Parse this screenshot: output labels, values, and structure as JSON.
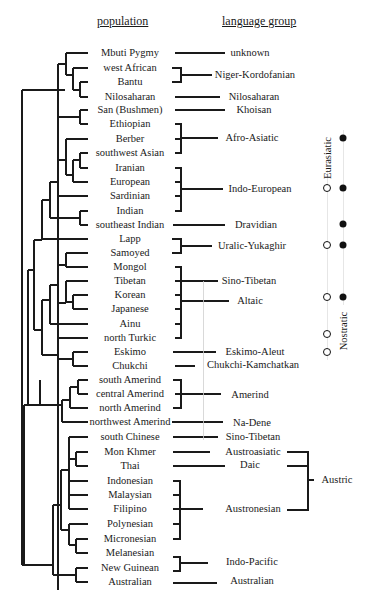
{
  "headers": {
    "population": "population",
    "language_group": "language group"
  },
  "populations": [
    {
      "name": "Mbuti Pygmy",
      "y": 53
    },
    {
      "name": "west African",
      "y": 68
    },
    {
      "name": "Bantu",
      "y": 82
    },
    {
      "name": "Nilosaharan",
      "y": 97
    },
    {
      "name": "San (Bushmen)",
      "y": 110
    },
    {
      "name": "Ethiopian",
      "y": 124
    },
    {
      "name": "Berber",
      "y": 139
    },
    {
      "name": "southwest Asian",
      "y": 153
    },
    {
      "name": "Iranian",
      "y": 168
    },
    {
      "name": "European",
      "y": 182
    },
    {
      "name": "Sardinian",
      "y": 196
    },
    {
      "name": "Indian",
      "y": 211
    },
    {
      "name": "southeast Indian",
      "y": 225
    },
    {
      "name": "Lapp",
      "y": 239
    },
    {
      "name": "Samoyed",
      "y": 253
    },
    {
      "name": "Mongol",
      "y": 267
    },
    {
      "name": "Tibetan",
      "y": 281
    },
    {
      "name": "Korean",
      "y": 295
    },
    {
      "name": "Japanese",
      "y": 309
    },
    {
      "name": "Ainu",
      "y": 324
    },
    {
      "name": "north Turkic",
      "y": 338
    },
    {
      "name": "Eskimo",
      "y": 352
    },
    {
      "name": "Chukchi",
      "y": 366
    },
    {
      "name": "south Amerind",
      "y": 380
    },
    {
      "name": "central Amerind",
      "y": 394
    },
    {
      "name": "north Amerind",
      "y": 408
    },
    {
      "name": "northwest Amerind",
      "y": 422
    },
    {
      "name": "south Chinese",
      "y": 437
    },
    {
      "name": "Mon Khmer",
      "y": 452
    },
    {
      "name": "Thai",
      "y": 466
    },
    {
      "name": "Indonesian",
      "y": 481
    },
    {
      "name": "Malaysian",
      "y": 495
    },
    {
      "name": "Filipino",
      "y": 509
    },
    {
      "name": "Polynesian",
      "y": 524
    },
    {
      "name": "Micronesian",
      "y": 539
    },
    {
      "name": "Melanesian",
      "y": 553
    },
    {
      "name": "New Guinean",
      "y": 568
    },
    {
      "name": "Australian",
      "y": 582
    }
  ],
  "language_groups": [
    {
      "name": "unknown",
      "x": 250,
      "y": 53
    },
    {
      "name": "Niger-Kordofanian",
      "x": 255,
      "y": 75
    },
    {
      "name": "Nilosaharan",
      "x": 254,
      "y": 97
    },
    {
      "name": "Khoisan",
      "x": 254,
      "y": 110
    },
    {
      "name": "Afro-Asiatic",
      "x": 252,
      "y": 138
    },
    {
      "name": "Indo-European",
      "x": 260,
      "y": 189
    },
    {
      "name": "Dravidian",
      "x": 256,
      "y": 225
    },
    {
      "name": "Uralic-Yukaghir",
      "x": 252,
      "y": 246
    },
    {
      "name": "Sino-Tibetan",
      "x": 249,
      "y": 281
    },
    {
      "name": "Altaic",
      "x": 250,
      "y": 301
    },
    {
      "name": "Eskimo-Aleut",
      "x": 255,
      "y": 352
    },
    {
      "name": "Chukchi-Kamchatkan",
      "x": 253,
      "y": 365
    },
    {
      "name": "Amerind",
      "x": 250,
      "y": 395
    },
    {
      "name": "Na-Dene",
      "x": 252,
      "y": 423
    },
    {
      "name": "Sino-Tibetan",
      "x": 253,
      "y": 437
    },
    {
      "name": "Austroasiatic",
      "x": 253,
      "y": 452
    },
    {
      "name": "Daic",
      "x": 250,
      "y": 465
    },
    {
      "name": "Austronesian",
      "x": 253,
      "y": 509
    },
    {
      "name": "Indo-Pacific",
      "x": 252,
      "y": 562
    },
    {
      "name": "Australian",
      "x": 252,
      "y": 581
    }
  ],
  "superfamilies": {
    "austric": {
      "name": "Austric",
      "x": 337,
      "y": 480
    },
    "eurasiatic": {
      "name": "Eurasiatic",
      "x": 327,
      "y": 158
    },
    "nostratic": {
      "name": "Nostratic",
      "x": 343,
      "y": 331
    }
  },
  "markers": {
    "eurasiatic_hollow": [
      188,
      245,
      297,
      334,
      352
    ],
    "nostratic_filled": [
      138,
      188,
      224,
      245,
      297
    ]
  },
  "colors": {
    "line": "#1a1a1a",
    "faint_line": "#cfcfcf",
    "background": "#ffffff"
  }
}
